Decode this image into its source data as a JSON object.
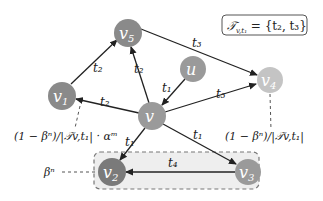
{
  "diagram": {
    "legend_box": {
      "text": "𝒯v,t1 = {t2, t3}",
      "lhs": "𝒯",
      "sub": "v,t₁",
      "rhs": " = {t₂, t₃}"
    },
    "nodes": [
      {
        "id": "v5",
        "label": "v",
        "sub": "5",
        "x": 128,
        "y": 33,
        "color": "#8a8a8a"
      },
      {
        "id": "u",
        "label": "u",
        "sub": "",
        "x": 193,
        "y": 69,
        "color": "#9a9a9a"
      },
      {
        "id": "v4",
        "label": "v",
        "sub": "4",
        "x": 270,
        "y": 80,
        "color": "#c4c4c4"
      },
      {
        "id": "v1",
        "label": "v",
        "sub": "1",
        "x": 62,
        "y": 96,
        "color": "#8a8a8a"
      },
      {
        "id": "v",
        "label": "v",
        "sub": "",
        "x": 152,
        "y": 116,
        "color": "#9a9a9a"
      },
      {
        "id": "v2",
        "label": "v",
        "sub": "2",
        "x": 112,
        "y": 172,
        "color": "#7a7a7a"
      },
      {
        "id": "v3",
        "label": "v",
        "sub": "3",
        "x": 248,
        "y": 172,
        "color": "#9a9a9a"
      }
    ],
    "edges": [
      {
        "from": "v1",
        "to": "v5",
        "label": "t₂"
      },
      {
        "from": "v",
        "to": "v5",
        "label": "t₂"
      },
      {
        "from": "v5",
        "to": "v4",
        "label": "t₃"
      },
      {
        "from": "u",
        "to": "v",
        "label": "t₁"
      },
      {
        "from": "v",
        "to": "v1",
        "label": "t₂"
      },
      {
        "from": "v",
        "to": "v4",
        "label": "t₃"
      },
      {
        "from": "v",
        "to": "v2",
        "label": "t₁"
      },
      {
        "from": "v",
        "to": "v3",
        "label": "t₁"
      },
      {
        "from": "v3",
        "to": "v2",
        "label": "t₄"
      }
    ],
    "annotations": {
      "left_formula": "(1 − βⁿ)/|𝒯v,t₁| · αᵐ",
      "right_formula": "(1 − βⁿ)/|𝒯v,t₁|",
      "beta_label": "βⁿ"
    },
    "group_box": {
      "members": [
        "v2",
        "v3"
      ],
      "fill": "#eeeeee",
      "stroke": "#777777"
    }
  }
}
